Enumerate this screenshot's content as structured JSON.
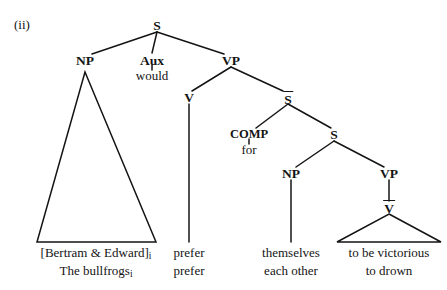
{
  "figure": {
    "enumerator": "(ii)",
    "type": "syntax-tree",
    "background_color": "#ffffff",
    "line_color": "#141414",
    "text_color": "#141414"
  },
  "nodes": {
    "s_root": {
      "label": "S",
      "x": 157,
      "y": 26
    },
    "np_subject": {
      "label": "NP",
      "x": 85,
      "y": 61
    },
    "aux": {
      "label": "Aux",
      "x": 152,
      "y": 61
    },
    "aux_word": {
      "label": "would",
      "x": 152,
      "y": 76
    },
    "vp_matrix": {
      "label": "VP",
      "x": 231,
      "y": 61
    },
    "v_matrix": {
      "label": "V",
      "x": 189,
      "y": 98
    },
    "s_bar": {
      "label": "S",
      "bar": true,
      "x": 288,
      "y": 98
    },
    "comp": {
      "label": "COMP",
      "x": 249,
      "y": 135
    },
    "comp_word": {
      "label": "for",
      "x": 249,
      "y": 150
    },
    "s_embedded": {
      "label": "S",
      "x": 334,
      "y": 135
    },
    "np_embedded": {
      "label": "NP",
      "x": 291,
      "y": 174
    },
    "vp_embedded": {
      "label": "VP",
      "x": 389,
      "y": 174
    },
    "v_bar": {
      "label": "V",
      "bar": true,
      "x": 389,
      "y": 207
    }
  },
  "terminals": {
    "subject_line1_pre": "[Bertram & Edward]",
    "subject_line1_sub": "i",
    "subject_line2_pre": "The bullfrogs",
    "subject_line2_sub": "i",
    "verb_line1": "prefer",
    "verb_line2": "prefer",
    "embedded_np_line1": "themselves",
    "embedded_np_line2": "each other",
    "embedded_vp_line1": "to be victorious",
    "embedded_vp_line2": "to drown"
  },
  "terminal_positions": {
    "subject_x": 96,
    "verb_x": 189,
    "embedded_np_x": 291,
    "embedded_vp_x": 389,
    "row1_y": 252,
    "row2_y": 270
  },
  "triangles": {
    "np_subject": {
      "apex_x": 85,
      "apex_y": 72,
      "left_x": 37,
      "right_x": 156,
      "base_y": 242
    },
    "v_bar": {
      "apex_x": 389,
      "apex_y": 214,
      "left_x": 337,
      "right_x": 441,
      "base_y": 242
    }
  },
  "edges": [
    {
      "name": "s-to-np",
      "x1": 157,
      "y1": 32,
      "x2": 92,
      "y2": 54
    },
    {
      "name": "s-to-aux",
      "x1": 157,
      "y1": 32,
      "x2": 152,
      "y2": 53
    },
    {
      "name": "s-to-vp",
      "x1": 157,
      "y1": 32,
      "x2": 224,
      "y2": 54
    },
    {
      "name": "aux-to-would",
      "x1": 152,
      "y1": 65,
      "x2": 152,
      "y2": 70
    },
    {
      "name": "vp-to-v",
      "x1": 231,
      "y1": 67,
      "x2": 192,
      "y2": 91
    },
    {
      "name": "vp-to-sbar",
      "x1": 231,
      "y1": 67,
      "x2": 283,
      "y2": 91
    },
    {
      "name": "v-to-prefer",
      "x1": 189,
      "y1": 104,
      "x2": 189,
      "y2": 242
    },
    {
      "name": "sbar-to-comp",
      "x1": 288,
      "y1": 104,
      "x2": 256,
      "y2": 128
    },
    {
      "name": "sbar-to-s",
      "x1": 288,
      "y1": 104,
      "x2": 331,
      "y2": 128
    },
    {
      "name": "comp-to-for",
      "x1": 249,
      "y1": 139,
      "x2": 249,
      "y2": 144
    },
    {
      "name": "s-to-np-embedded",
      "x1": 334,
      "y1": 141,
      "x2": 296,
      "y2": 167
    },
    {
      "name": "s-to-vp-embedded",
      "x1": 334,
      "y1": 141,
      "x2": 384,
      "y2": 167
    },
    {
      "name": "np-to-themselves",
      "x1": 291,
      "y1": 180,
      "x2": 291,
      "y2": 242
    },
    {
      "name": "vp-to-vbar",
      "x1": 389,
      "y1": 180,
      "x2": 389,
      "y2": 201
    }
  ]
}
